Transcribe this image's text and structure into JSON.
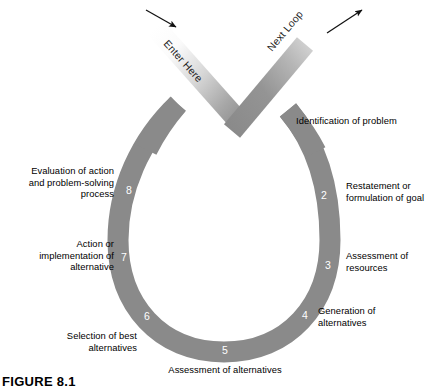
{
  "figure": {
    "caption": "FIGURE 8.1",
    "band_color": "#8a8a8a",
    "band_color_light": "#f2f2f2",
    "text_color": "#000000",
    "number_color": "#ffffff",
    "background": "#ffffff"
  },
  "entry": {
    "label": "Enter Here",
    "arrow": "arrow-down-right"
  },
  "exit": {
    "label_on_band": "Exit to",
    "label_off_band": "Next Loop",
    "full_label": "Exit to Next Loop",
    "arrow": "arrow-up-right"
  },
  "steps": [
    {
      "number": "1",
      "label": "Identification of problem",
      "align": "left"
    },
    {
      "number": "2",
      "label": "Restatement or\nformulation of goal",
      "align": "left"
    },
    {
      "number": "3",
      "label": "Assessment of\nresources",
      "align": "left"
    },
    {
      "number": "4",
      "label": "Generation of\nalternatives",
      "align": "left"
    },
    {
      "number": "5",
      "label": "Assessment of alternatives",
      "align": "center"
    },
    {
      "number": "6",
      "label": "Selection of best\nalternatives",
      "align": "right"
    },
    {
      "number": "7",
      "label": "Action or\nimplementation of\nalternative",
      "align": "right"
    },
    {
      "number": "8",
      "label": "Evaluation of action\nand problem-solving\nprocess",
      "align": "right"
    }
  ]
}
